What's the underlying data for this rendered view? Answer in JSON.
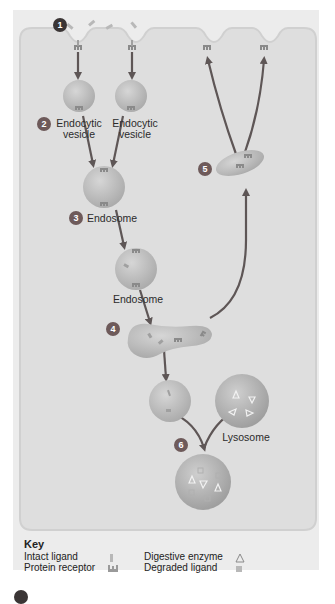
{
  "diagram": {
    "steps": [
      {
        "number": "1",
        "label": ""
      },
      {
        "number": "2",
        "label": "Endocytic vesicle"
      },
      {
        "number": "3",
        "label": "Endosome"
      },
      {
        "number": "4",
        "label": ""
      },
      {
        "number": "5",
        "label": ""
      },
      {
        "number": "6",
        "label": ""
      }
    ],
    "labels": {
      "endocytic_vesicle_left_line1": "Endocytic",
      "endocytic_vesicle_left_line2": "vesicle",
      "endocytic_vesicle_right_line1": "Endocytic",
      "endocytic_vesicle_right_line2": "vesicle",
      "endosome_1": "Endosome",
      "endosome_2": "Endosome",
      "lysosome": "Lysosome"
    },
    "colors": {
      "cell": "#dedede",
      "membrane_edge": "#cfcfcf",
      "vesicle": "#c9c9c9",
      "vesicle_dark": "#b7b7b7",
      "arrow": "#5e5656",
      "step_badge": "#6e5a5a",
      "step_badge_dark": "#3a3535"
    }
  },
  "key": {
    "title": "Key",
    "items": [
      {
        "label": "Intact ligand",
        "symbol": "bar"
      },
      {
        "label": "Protein receptor",
        "symbol": "receptor"
      },
      {
        "label": "Digestive enzyme",
        "symbol": "triangle"
      },
      {
        "label": "Degraded ligand",
        "symbol": "square"
      }
    ]
  }
}
